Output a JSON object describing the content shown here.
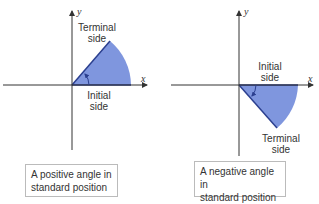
{
  "colors": {
    "wedge_fill": "#7f96de",
    "wedge_edge": "#2b3f8f",
    "axis": "#333333"
  },
  "left": {
    "y_label": "y",
    "x_label": "x",
    "terminal_label_1": "Terminal",
    "terminal_label_2": "side",
    "initial_label_1": "Initial",
    "initial_label_2": "side",
    "caption_1": "A positive angle in",
    "caption_2": "standard position"
  },
  "right": {
    "y_label": "y",
    "x_label": "x",
    "initial_label_1": "Initial",
    "initial_label_2": "side",
    "terminal_label_1": "Terminal",
    "terminal_label_2": "side",
    "caption_1": "A negative angle in",
    "caption_2": "standard position"
  }
}
